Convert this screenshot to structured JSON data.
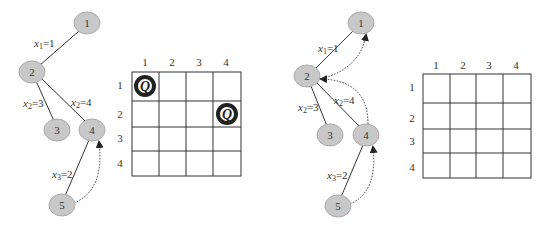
{
  "left_panel": {
    "nodes": [
      {
        "id": "1",
        "label": "1",
        "cx": 87,
        "cy": 23
      },
      {
        "id": "2",
        "label": "2",
        "cx": 32,
        "cy": 72
      },
      {
        "id": "3",
        "label": "3",
        "cx": 57,
        "cy": 130
      },
      {
        "id": "4",
        "label": "4",
        "cx": 92,
        "cy": 130
      },
      {
        "id": "5",
        "label": "5",
        "cx": 62,
        "cy": 205
      }
    ],
    "edges": [
      {
        "from": "1",
        "to": "2",
        "label_var": "x",
        "label_sub": "1",
        "label_val": "=1",
        "lx": 35,
        "ly": 45
      },
      {
        "from": "2",
        "to": "3",
        "label_var": "x",
        "label_sub": "2",
        "label_val": "=3",
        "lx": 23,
        "ly": 105
      },
      {
        "from": "2",
        "to": "4",
        "label_var": "x",
        "label_sub": "2",
        "label_val": "=4",
        "lx": 71,
        "ly": 104
      },
      {
        "from": "4",
        "to": "5",
        "label_var": "x",
        "label_sub": "3",
        "label_val": "=2",
        "lx": 52,
        "ly": 176
      }
    ],
    "backtrack_arrows": [
      {
        "from": "5",
        "to": "4"
      }
    ],
    "board": {
      "col_labels": [
        "1",
        "2",
        "3",
        "4"
      ],
      "row_labels": [
        "1",
        "2",
        "3",
        "4"
      ],
      "queens": [
        {
          "row": 1,
          "col": 1,
          "symbol": "Q"
        },
        {
          "row": 2,
          "col": 4,
          "symbol": "Q"
        }
      ]
    }
  },
  "right_panel": {
    "nodes": [
      {
        "id": "1",
        "label": "1",
        "cx": 361,
        "cy": 23
      },
      {
        "id": "2",
        "label": "2",
        "cx": 307,
        "cy": 76
      },
      {
        "id": "3",
        "label": "3",
        "cx": 330,
        "cy": 135
      },
      {
        "id": "4",
        "label": "4",
        "cx": 366,
        "cy": 135
      },
      {
        "id": "5",
        "label": "5",
        "cx": 338,
        "cy": 206
      }
    ],
    "edges": [
      {
        "from": "1",
        "to": "2",
        "label_var": "x",
        "label_sub": "1",
        "label_val": "=1",
        "lx": 318,
        "ly": 51
      },
      {
        "from": "2",
        "to": "3",
        "label_var": "x",
        "label_sub": "2",
        "label_val": "=3",
        "lx": 298,
        "ly": 110
      },
      {
        "from": "2",
        "to": "4",
        "label_var": "x",
        "label_sub": "2",
        "label_val": "=4",
        "lx": 334,
        "ly": 103
      },
      {
        "from": "4",
        "to": "5",
        "label_var": "x",
        "label_sub": "3",
        "label_val": "=2",
        "lx": 327,
        "ly": 178
      }
    ],
    "backtrack_arrows": [
      {
        "from": "5",
        "to": "4"
      },
      {
        "from": "4",
        "to": "2"
      },
      {
        "from": "2",
        "to": "1"
      }
    ],
    "board": {
      "col_labels": [
        "1",
        "2",
        "3",
        "4"
      ],
      "row_labels": [
        "1",
        "2",
        "3",
        "4"
      ],
      "queens": []
    }
  },
  "colors": {
    "node_fill": "#c8c8c8",
    "node_stroke": "#aaaaaa",
    "line": "#333333",
    "queen": "#222222"
  }
}
